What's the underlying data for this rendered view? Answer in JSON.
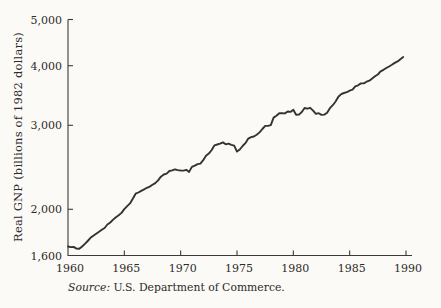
{
  "colors": {
    "background": "#fbfaf6",
    "ink": "#2b2b2b",
    "axis": "#3a3a3a",
    "line": "#333333"
  },
  "chart_data": {
    "type": "line",
    "title": "",
    "xlabel": "",
    "ylabel": "Real GNP (billions of 1982 dollars)",
    "source_label": "Source:",
    "source_text": " U.S. Department of Commerce.",
    "y_scale": "log",
    "grid": false,
    "legend": "none",
    "xlim": [
      1960,
      1990
    ],
    "ylim": [
      1600,
      5000
    ],
    "x_ticks": [
      {
        "value": 1960,
        "label": "1960"
      },
      {
        "value": 1965,
        "label": "1965"
      },
      {
        "value": 1970,
        "label": "1970"
      },
      {
        "value": 1975,
        "label": "1975"
      },
      {
        "value": 1980,
        "label": "1980"
      },
      {
        "value": 1985,
        "label": "1985"
      },
      {
        "value": 1990,
        "label": "1990"
      }
    ],
    "y_ticks": [
      {
        "value": 1600,
        "label": "1,600"
      },
      {
        "value": 2000,
        "label": "2,000"
      },
      {
        "value": 3000,
        "label": "3,000"
      },
      {
        "value": 4000,
        "label": "4,000"
      },
      {
        "value": 5000,
        "label": "5,000"
      }
    ],
    "x_start": 1960,
    "x_step": 0.25,
    "x_unit": "year (quarterly data)",
    "series": [
      {
        "name": "Real GNP",
        "values": [
          1671,
          1666,
          1668,
          1654,
          1653,
          1671,
          1692,
          1716,
          1743,
          1760,
          1778,
          1794,
          1811,
          1827,
          1858,
          1876,
          1903,
          1925,
          1943,
          1965,
          2002,
          2031,
          2058,
          2105,
          2156,
          2169,
          2186,
          2201,
          2219,
          2231,
          2251,
          2269,
          2300,
          2341,
          2366,
          2376,
          2406,
          2413,
          2426,
          2417,
          2412,
          2411,
          2420,
          2396,
          2454,
          2469,
          2487,
          2494,
          2535,
          2590,
          2617,
          2663,
          2724,
          2735,
          2745,
          2762,
          2737,
          2746,
          2730,
          2719,
          2642,
          2669,
          2715,
          2752,
          2813,
          2832,
          2842,
          2865,
          2899,
          2947,
          2991,
          2992,
          3003,
          3114,
          3142,
          3181,
          3181,
          3178,
          3207,
          3201,
          3233,
          3157,
          3159,
          3199,
          3261,
          3250,
          3264,
          3219,
          3170,
          3180,
          3154,
          3159,
          3186,
          3258,
          3306,
          3365,
          3444,
          3487,
          3507,
          3520,
          3548,
          3562,
          3621,
          3640,
          3672,
          3672,
          3703,
          3720,
          3761,
          3800,
          3834,
          3892,
          3921,
          3957,
          3984,
          4018,
          4054,
          4084,
          4127,
          4170
        ]
      }
    ]
  }
}
